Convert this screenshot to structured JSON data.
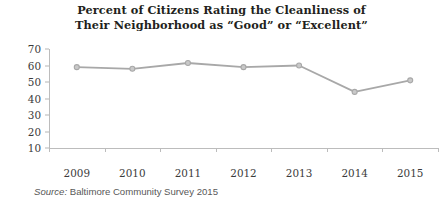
{
  "chart_data": {
    "type": "line",
    "title": "Percent of Citizens Rating the Cleanliness of Their Neighborhood as “Good” or “Excellent”",
    "title_lines": [
      "Percent of Citizens Rating the Cleanliness of",
      "Their Neighborhood as “Good” or “Excellent”"
    ],
    "categories": [
      "2009",
      "2010",
      "2011",
      "2012",
      "2013",
      "2014",
      "2015"
    ],
    "values": [
      59,
      58,
      61.5,
      59,
      60,
      44,
      51
    ],
    "series": [
      {
        "name": "Percent rating cleanliness Good or Excellent",
        "values": [
          59,
          58,
          61.5,
          59,
          60,
          44,
          51
        ]
      }
    ],
    "xlabel": "",
    "ylabel": "",
    "ylim": [
      0,
      70
    ],
    "yticks": [
      10,
      20,
      30,
      40,
      50,
      60,
      70
    ],
    "ytick_labels": [
      "10",
      "20",
      "30",
      "40",
      "50",
      "60",
      "70"
    ],
    "grid": false,
    "legend": false,
    "line_color": "#a8a8a8",
    "marker_color": "#a8a8a8",
    "axis_color": "#bcbcbc",
    "text_color": "#231f20"
  },
  "source": {
    "label": "Source:",
    "text": "Baltimore Community Survey 2015"
  }
}
